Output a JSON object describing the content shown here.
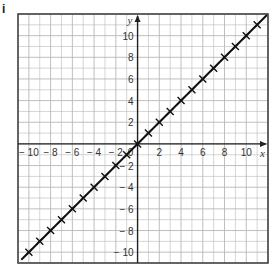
{
  "part_label": "i",
  "chart_data": {
    "type": "line",
    "title": "",
    "xlabel": "x",
    "ylabel": "y",
    "xlim": [
      -11,
      12
    ],
    "ylim": [
      -11,
      12
    ],
    "grid": true,
    "x_ticks": [
      "-10",
      "-8",
      "-6",
      "-4",
      "-2",
      "0",
      "2",
      "4",
      "6",
      "8",
      "10"
    ],
    "y_ticks": [
      "10",
      "8",
      "6",
      "4",
      "2",
      "-2",
      "-4",
      "-6",
      "-8",
      "-10"
    ],
    "series": [
      {
        "name": "y = x",
        "marker": "x",
        "x": [
          -10,
          -9,
          -8,
          -7,
          -6,
          -5,
          -4,
          -3,
          -2,
          -1,
          0,
          1,
          2,
          3,
          4,
          5,
          6,
          7,
          8,
          9,
          10,
          11
        ],
        "y": [
          -10,
          -9,
          -8,
          -7,
          -6,
          -5,
          -4,
          -3,
          -2,
          -1,
          0,
          1,
          2,
          3,
          4,
          5,
          6,
          7,
          8,
          9,
          10,
          11
        ]
      }
    ],
    "colors": {
      "grid": "#b8b8b8",
      "axis": "#222222",
      "line": "#111111"
    }
  }
}
